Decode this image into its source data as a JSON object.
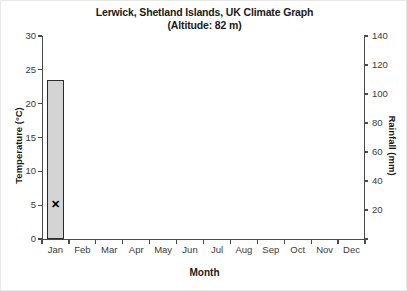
{
  "title": {
    "main": "Lerwick, Shetland Islands, UK Climate Graph",
    "sub": "(Altitude: 82 m)"
  },
  "axes": {
    "y_left_label": "Temperature (°C)",
    "y_right_label": "Rainfall (mm)",
    "x_label": "Month"
  },
  "colors": {
    "bar_fill": "#d4d4d4",
    "bar_edge": "#2b2b2b",
    "marker": "#000000",
    "axis": "#4a4a4a"
  },
  "chart_data": {
    "type": "bar",
    "title": "Lerwick, Shetland Islands, UK Climate Graph (Altitude: 82 m)",
    "xlabel": "Month",
    "ylabel": "Temperature (°C)",
    "y2label": "Rainfall (mm)",
    "grid": false,
    "legend": "none",
    "categories": [
      "Jan",
      "Feb",
      "Mar",
      "Apr",
      "May",
      "Jun",
      "Jul",
      "Aug",
      "Sep",
      "Oct",
      "Nov",
      "Dec"
    ],
    "ylim": [
      0,
      30
    ],
    "yticks": [
      "0",
      "5",
      "10",
      "15",
      "20",
      "25",
      "30"
    ],
    "y2lim": [
      0,
      140
    ],
    "y2ticks": [
      "",
      "20",
      "40",
      "60",
      "80",
      "100",
      "120",
      "140"
    ],
    "series": [
      {
        "name": "Rainfall (mm)",
        "kind": "bar",
        "axis": "right",
        "values": [
          110,
          null,
          null,
          null,
          null,
          null,
          null,
          null,
          null,
          null,
          null,
          null
        ]
      },
      {
        "name": "Temperature (°C)",
        "kind": "marker",
        "marker": "x",
        "axis": "left",
        "values": [
          5,
          null,
          null,
          null,
          null,
          null,
          null,
          null,
          null,
          null,
          null,
          null
        ]
      }
    ]
  }
}
